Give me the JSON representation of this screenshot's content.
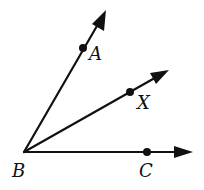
{
  "diagram": {
    "type": "geometry-angle-rays",
    "vertex": {
      "label": "B",
      "x": 24,
      "y": 152
    },
    "rays": [
      {
        "name": "BA",
        "point_label": "A",
        "point": {
          "x": 83,
          "y": 48
        },
        "tip": {
          "x": 106,
          "y": 10
        }
      },
      {
        "name": "BX",
        "point_label": "X",
        "point": {
          "x": 130,
          "y": 92
        },
        "tip": {
          "x": 169,
          "y": 70
        }
      },
      {
        "name": "BC",
        "point_label": "C",
        "point": {
          "x": 147,
          "y": 152
        },
        "tip": {
          "x": 193,
          "y": 152
        }
      }
    ],
    "labels": {
      "A": "A",
      "X": "X",
      "B": "B",
      "C": "C"
    },
    "color": "#111111"
  }
}
